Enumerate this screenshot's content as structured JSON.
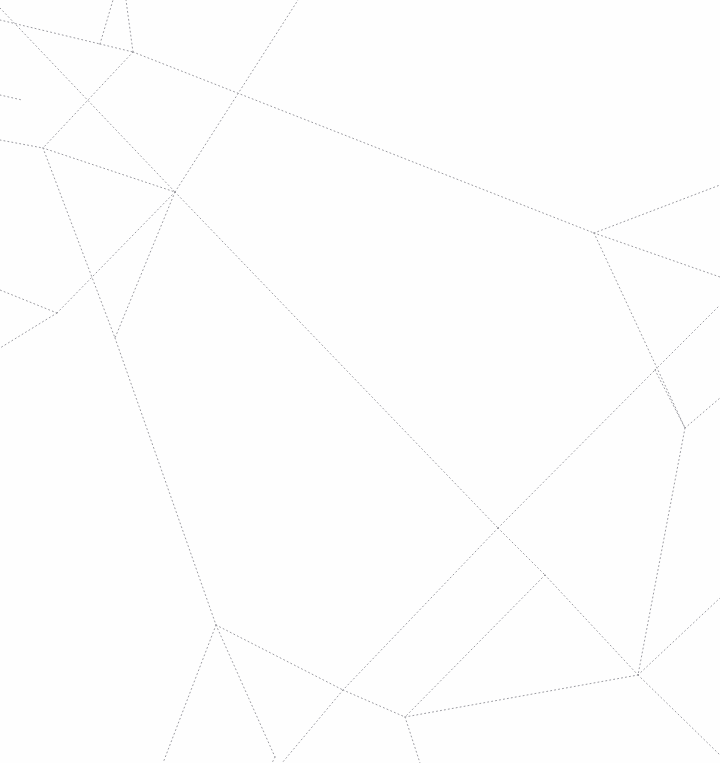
{
  "canvas": {
    "width": 720,
    "height": 763,
    "background_color": "#fefefe",
    "title": "Dotted line arrangement",
    "description": "Planar subdivision of faint gray dotted straight-line segments on a white field"
  },
  "style": {
    "stroke_color": "#9a9aa0",
    "stroke_width": 1,
    "dash_pattern": "1 3",
    "line_cap": "round"
  },
  "chart_data": {
    "type": "scatter",
    "xlabel": "",
    "ylabel": "",
    "xlim": [
      0,
      720
    ],
    "ylim": [
      0,
      763
    ],
    "grid": false,
    "legend": null,
    "annotations": [],
    "vertices": [
      {
        "id": "v-six-way",
        "x": 175,
        "y": 192,
        "degree": 6
      },
      {
        "id": "v-upper-left-a",
        "x": 100,
        "y": 44,
        "degree": 3
      },
      {
        "id": "v-upper-left-b",
        "x": 133,
        "y": 52,
        "degree": 3
      },
      {
        "id": "v-left-upper",
        "x": 43,
        "y": 148,
        "degree": 3
      },
      {
        "id": "v-left-mid-a",
        "x": 57,
        "y": 313,
        "degree": 3
      },
      {
        "id": "v-left-mid-b",
        "x": 115,
        "y": 338,
        "degree": 3
      },
      {
        "id": "v-right-upper",
        "x": 594,
        "y": 233,
        "degree": 4
      },
      {
        "id": "v-right-mid-a",
        "x": 655,
        "y": 370,
        "degree": 4
      },
      {
        "id": "v-right-mid-b",
        "x": 685,
        "y": 428,
        "degree": 4
      },
      {
        "id": "v-center-cross-a",
        "x": 498,
        "y": 528,
        "degree": 4
      },
      {
        "id": "v-center-cross-b",
        "x": 545,
        "y": 575,
        "degree": 4
      },
      {
        "id": "v-lower-left",
        "x": 216,
        "y": 625,
        "degree": 4
      },
      {
        "id": "v-lower-center-a",
        "x": 343,
        "y": 690,
        "degree": 4
      },
      {
        "id": "v-lower-center-b",
        "x": 405,
        "y": 717,
        "degree": 4
      },
      {
        "id": "v-lower-right",
        "x": 638,
        "y": 675,
        "degree": 4
      },
      {
        "id": "v-bottom-v",
        "x": 275,
        "y": 757,
        "degree": 2
      }
    ],
    "edges": [
      {
        "id": "e-01",
        "name": "top-left-corner-to-hub",
        "x1": 0,
        "y1": 8,
        "x2": 175,
        "y2": 192
      },
      {
        "id": "e-02",
        "name": "left-edge-to-upper-left-a",
        "x1": 0,
        "y1": 20,
        "x2": 100,
        "y2": 44
      },
      {
        "id": "e-03",
        "name": "upper-left-a-to-top-edge",
        "x1": 100,
        "y1": 44,
        "x2": 113,
        "y2": 0
      },
      {
        "id": "e-04",
        "name": "upper-left-a-to-upper-left-b",
        "x1": 100,
        "y1": 44,
        "x2": 133,
        "y2": 52
      },
      {
        "id": "e-05",
        "name": "upper-left-b-to-top-edge",
        "x1": 133,
        "y1": 52,
        "x2": 126,
        "y2": 0
      },
      {
        "id": "e-06",
        "name": "upper-left-b-to-right-upper",
        "x1": 133,
        "y1": 52,
        "x2": 594,
        "y2": 233
      },
      {
        "id": "e-07",
        "name": "upper-left-b-to-left-upper",
        "x1": 133,
        "y1": 52,
        "x2": 43,
        "y2": 148
      },
      {
        "id": "e-08",
        "name": "left-edge-to-left-upper",
        "x1": 0,
        "y1": 140,
        "x2": 43,
        "y2": 148
      },
      {
        "id": "e-09",
        "name": "left-upper-to-hub",
        "x1": 43,
        "y1": 148,
        "x2": 175,
        "y2": 192
      },
      {
        "id": "e-10",
        "name": "left-upper-to-left-mid-b",
        "x1": 43,
        "y1": 148,
        "x2": 115,
        "y2": 338
      },
      {
        "id": "e-11",
        "name": "hub-to-top-edge",
        "x1": 175,
        "y1": 192,
        "x2": 298,
        "y2": 0
      },
      {
        "id": "e-12",
        "name": "hub-to-left-mid-a",
        "x1": 175,
        "y1": 192,
        "x2": 57,
        "y2": 313
      },
      {
        "id": "e-13",
        "name": "hub-to-left-mid-b",
        "x1": 175,
        "y1": 192,
        "x2": 115,
        "y2": 338
      },
      {
        "id": "e-14",
        "name": "hub-to-center-cross-a",
        "x1": 175,
        "y1": 192,
        "x2": 498,
        "y2": 528
      },
      {
        "id": "e-15",
        "name": "left-mid-a-to-left-edge",
        "x1": 57,
        "y1": 313,
        "x2": 0,
        "y2": 290
      },
      {
        "id": "e-16",
        "name": "left-mid-a-to-left-edge-low",
        "x1": 57,
        "y1": 313,
        "x2": 0,
        "y2": 348
      },
      {
        "id": "e-17",
        "name": "left-mid-b-to-lower-left",
        "x1": 115,
        "y1": 338,
        "x2": 216,
        "y2": 625
      },
      {
        "id": "e-18",
        "name": "right-upper-to-right-edge-top",
        "x1": 594,
        "y1": 233,
        "x2": 720,
        "y2": 185
      },
      {
        "id": "e-19",
        "name": "right-upper-to-right-edge-mid",
        "x1": 594,
        "y1": 233,
        "x2": 720,
        "y2": 277
      },
      {
        "id": "e-20",
        "name": "right-upper-to-right-mid-b",
        "x1": 594,
        "y1": 233,
        "x2": 685,
        "y2": 428
      },
      {
        "id": "e-21",
        "name": "right-mid-a-to-right-edge",
        "x1": 655,
        "y1": 370,
        "x2": 720,
        "y2": 305
      },
      {
        "id": "e-22",
        "name": "right-mid-a-to-right-mid-b",
        "x1": 655,
        "y1": 370,
        "x2": 685,
        "y2": 428
      },
      {
        "id": "e-23",
        "name": "right-mid-b-to-right-edge",
        "x1": 685,
        "y1": 428,
        "x2": 720,
        "y2": 398
      },
      {
        "id": "e-24",
        "name": "right-mid-b-to-lower-right",
        "x1": 685,
        "y1": 428,
        "x2": 638,
        "y2": 675
      },
      {
        "id": "e-25",
        "name": "center-cross-a-to-center-cross-b",
        "x1": 498,
        "y1": 528,
        "x2": 545,
        "y2": 575
      },
      {
        "id": "e-26",
        "name": "center-cross-a-to-lower-center-a",
        "x1": 498,
        "y1": 528,
        "x2": 343,
        "y2": 690
      },
      {
        "id": "e-27",
        "name": "center-cross-a-to-right-mid-a",
        "x1": 498,
        "y1": 528,
        "x2": 655,
        "y2": 370
      },
      {
        "id": "e-28",
        "name": "center-cross-b-to-lower-center-b",
        "x1": 545,
        "y1": 575,
        "x2": 405,
        "y2": 717
      },
      {
        "id": "e-29",
        "name": "center-cross-b-to-lower-right",
        "x1": 545,
        "y1": 575,
        "x2": 638,
        "y2": 675
      },
      {
        "id": "e-30",
        "name": "lower-left-to-bottom-edge-left",
        "x1": 216,
        "y1": 625,
        "x2": 163,
        "y2": 763
      },
      {
        "id": "e-31",
        "name": "lower-left-to-bottom-v",
        "x1": 216,
        "y1": 625,
        "x2": 275,
        "y2": 757
      },
      {
        "id": "e-32",
        "name": "lower-left-to-lower-center-a",
        "x1": 216,
        "y1": 625,
        "x2": 343,
        "y2": 690
      },
      {
        "id": "e-33",
        "name": "lower-center-a-to-lower-center-b",
        "x1": 343,
        "y1": 690,
        "x2": 405,
        "y2": 717
      },
      {
        "id": "e-34",
        "name": "lower-center-a-to-bottom-edge",
        "x1": 343,
        "y1": 690,
        "x2": 282,
        "y2": 763
      },
      {
        "id": "e-35",
        "name": "lower-center-b-to-bottom-edge",
        "x1": 405,
        "y1": 717,
        "x2": 420,
        "y2": 763
      },
      {
        "id": "e-36",
        "name": "lower-center-b-to-lower-right",
        "x1": 405,
        "y1": 717,
        "x2": 638,
        "y2": 675
      },
      {
        "id": "e-37",
        "name": "lower-right-to-bottom-edge",
        "x1": 638,
        "y1": 675,
        "x2": 720,
        "y2": 755
      },
      {
        "id": "e-38",
        "name": "lower-right-to-right-edge",
        "x1": 638,
        "y1": 675,
        "x2": 720,
        "y2": 598
      },
      {
        "id": "e-39",
        "name": "bottom-v-to-bottom-edge",
        "x1": 275,
        "y1": 757,
        "x2": 272,
        "y2": 763
      },
      {
        "id": "e-40",
        "name": "left-edge-short-stub",
        "x1": 0,
        "y1": 95,
        "x2": 22,
        "y2": 100
      }
    ]
  }
}
